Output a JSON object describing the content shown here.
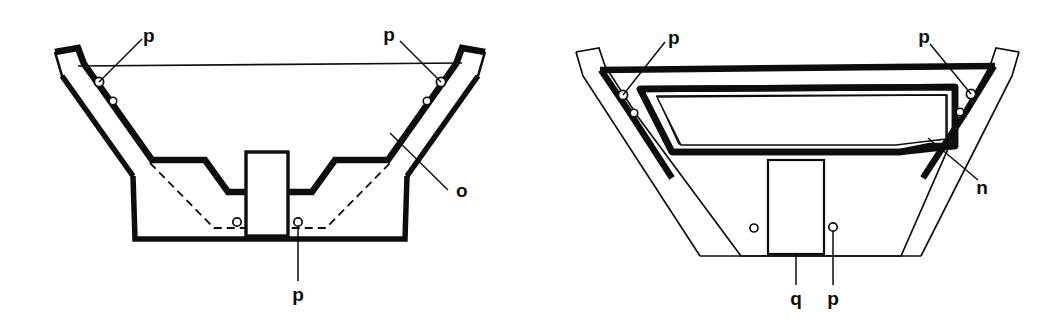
{
  "figure": {
    "domain": "technical-line-drawing",
    "background_color": "#ffffff",
    "ink_color": "#0d0d0d",
    "width": 1062,
    "height": 320,
    "views": [
      {
        "id": "left-view",
        "name": "left-cross-section",
        "description": "V-shaped trough cross-section with stepped side bands, dashed inner line, central pedestal block and six fastener holes",
        "labels": [
          {
            "key": "p_top_left",
            "text": "p"
          },
          {
            "key": "p_top_right",
            "text": "p"
          },
          {
            "key": "o_right",
            "text": "o"
          },
          {
            "key": "p_bottom",
            "text": "p"
          }
        ]
      },
      {
        "id": "right-view",
        "name": "right-cross-section",
        "description": "V-shaped trough cross-section with thick top rail, inner trapezoidal frame, central block and fastener holes",
        "labels": [
          {
            "key": "p_top_left",
            "text": "p"
          },
          {
            "key": "p_top_right",
            "text": "p"
          },
          {
            "key": "n_right",
            "text": "n"
          },
          {
            "key": "q_bottom",
            "text": "q"
          },
          {
            "key": "p_bottom",
            "text": "p"
          }
        ]
      }
    ]
  },
  "labels": {
    "left_p_top_left": "p",
    "left_p_top_right": "p",
    "left_o": "o",
    "left_p_bottom": "p",
    "right_p_top_left": "p",
    "right_p_top_right": "p",
    "right_n": "n",
    "right_q_bottom": "q",
    "right_p_bottom": "p"
  }
}
